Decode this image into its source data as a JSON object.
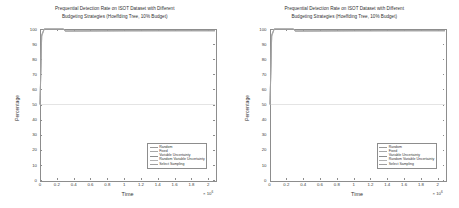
{
  "figure": {
    "panel_count": 2,
    "background": "#ffffff"
  },
  "chart_data": [
    {
      "type": "line",
      "title": "Prequential Detection Rate on ISOT Dataset with Different Budgeting Strategies (Hoeffding Tree, 10% Budget)",
      "title_line1": "Prequential Detection Rate on ISOT Dataset with Different",
      "title_line2": "Budgeting Strategies (Hoeffding Tree, 10% Budget)",
      "xlabel": "Time",
      "ylabel": "Percentage",
      "x_multiplier_text": "× 10",
      "x_multiplier_exp": "6",
      "xlim": [
        0,
        2.08
      ],
      "ylim": [
        0,
        100
      ],
      "xticks": [
        0,
        0.2,
        0.4,
        0.6,
        0.8,
        1,
        1.2,
        1.4,
        1.6,
        1.8,
        2
      ],
      "xtick_labels": [
        "0",
        "0.2",
        "0.4",
        "0.6",
        "0.8",
        "1",
        "1.2",
        "1.4",
        "1.6",
        "1.8",
        "2"
      ],
      "yticks": [
        0,
        10,
        20,
        30,
        40,
        50,
        60,
        70,
        80,
        90,
        100
      ],
      "ytick_labels": [
        "0",
        "10",
        "20",
        "30",
        "40",
        "50",
        "60",
        "70",
        "80",
        "90",
        "100"
      ],
      "grid": false,
      "legend_position": "lower right",
      "series": [
        {
          "name": "Random",
          "color": "#9a9a9a",
          "x": [
            0,
            0.02,
            0.05,
            0.28,
            0.3,
            0.6,
            1.0,
            1.4,
            1.8,
            2.08
          ],
          "values": [
            50,
            96,
            100,
            100,
            98.6,
            98.7,
            98.8,
            98.8,
            98.9,
            98.9
          ]
        },
        {
          "name": "Fixed",
          "color": "#a8a8a8",
          "x": [
            0,
            0.02,
            0.05,
            0.28,
            0.3,
            0.6,
            1.0,
            1.4,
            1.8,
            2.08
          ],
          "values": [
            50,
            95,
            100,
            100,
            98.5,
            98.6,
            98.7,
            98.8,
            98.8,
            98.8
          ]
        },
        {
          "name": "Variable Uncertainty",
          "color": "#8e8e8e",
          "x": [
            0,
            0.02,
            0.05,
            0.28,
            0.3,
            0.6,
            1.0,
            1.4,
            1.8,
            2.08
          ],
          "values": [
            50,
            96,
            100,
            100,
            98.8,
            98.9,
            99.0,
            99.0,
            99.0,
            99.0
          ]
        },
        {
          "name": "Random Variable Uncertainty",
          "color": "#b2b2b2",
          "x": [
            0,
            0.02,
            0.05,
            0.28,
            0.3,
            0.6,
            1.0,
            1.4,
            1.8,
            2.08
          ],
          "values": [
            50,
            95,
            100,
            100,
            98.4,
            98.5,
            98.6,
            98.7,
            98.7,
            98.7
          ]
        },
        {
          "name": "Select Sampling",
          "color": "#9f9f9f",
          "x": [
            0,
            0.02,
            0.05,
            0.28,
            0.3,
            0.6,
            1.0,
            1.4,
            1.8,
            2.08
          ],
          "values": [
            50,
            96,
            100,
            100,
            98.7,
            98.8,
            98.9,
            98.9,
            98.9,
            98.9
          ]
        }
      ],
      "baseline_annotation": {
        "y": 50,
        "color": "#c9c9c9"
      }
    },
    {
      "type": "line",
      "title": "Prequential Detection Rate on ISOT Dataset with Different Budgeting Strategies (Hoeffding Tree, 10% Budget)",
      "title_line1": "Prequential Detection Rate on ISOT Dataset with Different",
      "title_line2": "Budgeting Strategies (Hoeffding Tree, 10% Budget)",
      "xlabel": "Time",
      "ylabel": "Percentage",
      "x_multiplier_text": "× 10",
      "x_multiplier_exp": "6",
      "xlim": [
        0,
        2.08
      ],
      "ylim": [
        0,
        100
      ],
      "xticks": [
        0,
        0.2,
        0.4,
        0.6,
        0.8,
        1,
        1.2,
        1.4,
        1.6,
        1.8,
        2
      ],
      "xtick_labels": [
        "0",
        "0.2",
        "0.4",
        "0.6",
        "0.8",
        "1",
        "1.2",
        "1.4",
        "1.6",
        "1.8",
        "2"
      ],
      "yticks": [
        0,
        10,
        20,
        30,
        40,
        50,
        60,
        70,
        80,
        90,
        100
      ],
      "ytick_labels": [
        "0",
        "10",
        "20",
        "30",
        "40",
        "50",
        "60",
        "70",
        "80",
        "90",
        "100"
      ],
      "grid": false,
      "legend_position": "lower right",
      "series": [
        {
          "name": "Random",
          "color": "#9a9a9a",
          "x": [
            0,
            0.02,
            0.05,
            0.28,
            0.3,
            0.6,
            1.0,
            1.4,
            1.8,
            2.08
          ],
          "values": [
            50,
            96,
            100,
            100,
            98.6,
            98.7,
            98.8,
            98.8,
            98.9,
            98.9
          ]
        },
        {
          "name": "Fixed",
          "color": "#a8a8a8",
          "x": [
            0,
            0.02,
            0.05,
            0.28,
            0.3,
            0.6,
            1.0,
            1.4,
            1.8,
            2.08
          ],
          "values": [
            50,
            95,
            100,
            100,
            98.5,
            98.6,
            98.7,
            98.8,
            98.8,
            98.8
          ]
        },
        {
          "name": "Variable Uncertainty",
          "color": "#8e8e8e",
          "x": [
            0,
            0.02,
            0.05,
            0.28,
            0.3,
            0.6,
            1.0,
            1.4,
            1.8,
            2.08
          ],
          "values": [
            50,
            96,
            100,
            100,
            98.8,
            98.9,
            99.0,
            99.0,
            99.0,
            99.0
          ]
        },
        {
          "name": "Random Variable Uncertainty",
          "color": "#b2b2b2",
          "x": [
            0,
            0.02,
            0.05,
            0.28,
            0.3,
            0.6,
            1.0,
            1.4,
            1.8,
            2.08
          ],
          "values": [
            50,
            95,
            100,
            100,
            98.4,
            98.5,
            98.6,
            98.7,
            98.7,
            98.7
          ]
        },
        {
          "name": "Select Sampling",
          "color": "#9f9f9f",
          "x": [
            0,
            0.02,
            0.05,
            0.28,
            0.3,
            0.6,
            1.0,
            1.4,
            1.8,
            2.08
          ],
          "values": [
            50,
            96,
            100,
            100,
            98.7,
            98.8,
            98.9,
            98.9,
            98.9,
            98.9
          ]
        }
      ],
      "baseline_annotation": {
        "y": 50,
        "color": "#c9c9c9"
      }
    }
  ]
}
